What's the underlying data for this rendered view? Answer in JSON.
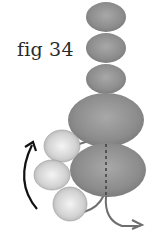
{
  "figure": {
    "label": "fig 34",
    "colors": {
      "dark_bead": "#8f8f8f",
      "light_bead": "#d6d6d6",
      "thread": "#6e6e6e",
      "arrow": "#111111",
      "text": "#2a2a2a"
    },
    "beads": {
      "stack": [
        "small-top-1",
        "small-top-2",
        "small-top-3",
        "large-middle",
        "large-bottom"
      ],
      "side": [
        "light-side-1",
        "light-side-2",
        "light-side-3"
      ]
    }
  }
}
